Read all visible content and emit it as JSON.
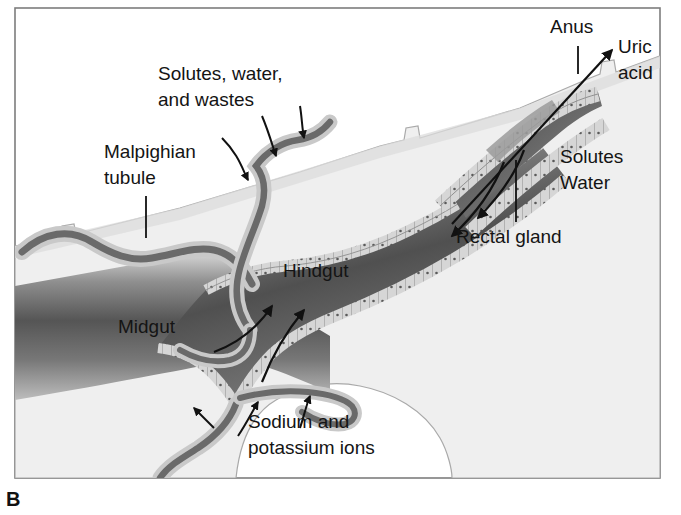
{
  "figure": {
    "panel_letter": "B",
    "frame": {
      "border_color": "#7d7d7d"
    },
    "background_color": "#ffffff",
    "body_fill_color": "#eeeeee",
    "gut_dark_color": "#4a4a4a",
    "gut_light_color": "#d9d9d9",
    "epithelium_color": "#d2d2d2"
  },
  "labels": {
    "solutes_water_wastes_line1": "Solutes, water,",
    "solutes_water_wastes_line2": "and wastes",
    "malpighian_line1": "Malpighian",
    "malpighian_line2": "tubule",
    "midgut": "Midgut",
    "hindgut": "Hindgut",
    "sodium_line1": "Sodium and",
    "sodium_line2": "potassium ions",
    "anus": "Anus",
    "uric_acid_line1": "Uric",
    "uric_acid_line2": "acid",
    "solutes": "Solutes",
    "water": "Water",
    "rectal_gland": "Rectal gland"
  },
  "structures": [
    {
      "name": "midgut",
      "label": "Midgut"
    },
    {
      "name": "hindgut",
      "label": "Hindgut"
    },
    {
      "name": "malpighian-tubule",
      "label": "Malpighian tubule"
    },
    {
      "name": "rectal-gland",
      "label": "Rectal gland"
    },
    {
      "name": "anus",
      "label": "Anus"
    }
  ],
  "flows": [
    {
      "name": "solutes-water-wastes-into-tubule",
      "label": "Solutes, water, and wastes",
      "direction": "into-tubule",
      "arrows": 3
    },
    {
      "name": "sodium-potassium-into-tubule",
      "label": "Sodium and potassium ions",
      "direction": "into-tubule",
      "arrows": 2
    },
    {
      "name": "uric-acid-out-anus",
      "label": "Uric acid",
      "direction": "out"
    },
    {
      "name": "solutes-reabsorbed",
      "label": "Solutes",
      "direction": "reabsorbed"
    },
    {
      "name": "water-reabsorbed",
      "label": "Water",
      "direction": "reabsorbed"
    },
    {
      "name": "flow-into-hindgut",
      "label": "",
      "direction": "into-hindgut",
      "arrows": 3
    }
  ]
}
